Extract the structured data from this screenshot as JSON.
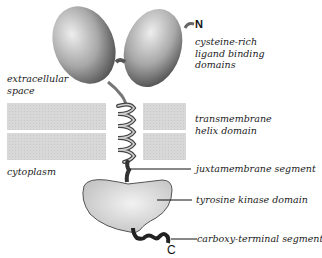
{
  "diagram": {
    "termini": {
      "n": "N",
      "c": "C"
    },
    "regions": {
      "extracellular": [
        "extracellular",
        "space"
      ],
      "cytoplasm": "cytoplasm"
    },
    "labels": {
      "ligand_binding": [
        "cysteine-rich",
        "ligand binding",
        "domains"
      ],
      "transmembrane": [
        "transmembrane",
        "helix domain"
      ],
      "juxtamembrane": "juxtamembrane segment",
      "kinase": "tyrosine kinase domain",
      "carboxy": "carboxy-terminal segment"
    },
    "colors": {
      "membrane": "#d9d9d9",
      "domain_dark": "#5a5a5a",
      "domain_light": "#e6e6e6",
      "kinase_fill": "#dcdcdc",
      "leader_line": "#111111"
    }
  }
}
